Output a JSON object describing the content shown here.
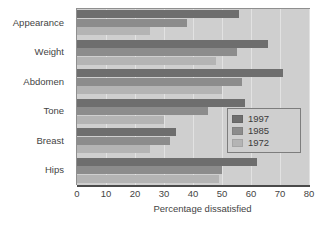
{
  "chart_data": {
    "type": "bar",
    "orientation": "horizontal",
    "title": "",
    "subtitle": "",
    "xlabel": "Percentage dissatisfied",
    "ylabel": "",
    "xlim": [
      0,
      80
    ],
    "xticks": [
      0,
      10,
      20,
      30,
      40,
      50,
      60,
      70,
      80
    ],
    "xtick_labels": [
      "0",
      "10",
      "20",
      "30",
      "40",
      "50",
      "60",
      "70",
      "80"
    ],
    "grid": true,
    "grid_axis": "x",
    "legend_position": "center-right",
    "categories": [
      "Appearance",
      "Weight",
      "Abdomen",
      "Tone",
      "Breast",
      "Hips"
    ],
    "series": [
      {
        "name": "1997",
        "color": "#6e6e6e",
        "values": [
          56,
          66,
          71,
          58,
          34,
          62
        ]
      },
      {
        "name": "1985",
        "color": "#8c8c8c",
        "values": [
          38,
          55,
          57,
          45,
          32,
          50
        ]
      },
      {
        "name": "1972",
        "color": "#b4b4b4",
        "values": [
          25,
          48,
          50,
          30,
          25,
          49
        ]
      }
    ]
  },
  "legend": {
    "entries": [
      {
        "label": "1997"
      },
      {
        "label": "1985"
      },
      {
        "label": "1972"
      }
    ]
  },
  "colors": {
    "plot_background": "#cfcfcf",
    "page_background": "#ffffff",
    "axis": "#4a4a4a",
    "gridline": "#e2e2e2",
    "text": "#444444",
    "series_1997": "#6e6e6e",
    "series_1985": "#8c8c8c",
    "series_1972": "#b4b4b4"
  }
}
